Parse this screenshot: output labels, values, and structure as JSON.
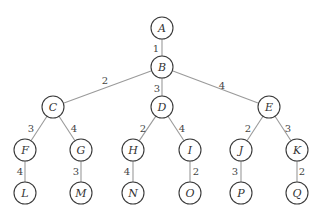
{
  "diagram": {
    "type": "weighted-tree",
    "nodes": [
      {
        "id": "A",
        "label": "A",
        "x": 162,
        "y": 28
      },
      {
        "id": "B",
        "label": "B",
        "x": 162,
        "y": 67
      },
      {
        "id": "C",
        "label": "C",
        "x": 53,
        "y": 107
      },
      {
        "id": "D",
        "label": "D",
        "x": 162,
        "y": 107
      },
      {
        "id": "E",
        "label": "E",
        "x": 269,
        "y": 107
      },
      {
        "id": "F",
        "label": "F",
        "x": 25,
        "y": 150
      },
      {
        "id": "G",
        "label": "G",
        "x": 81,
        "y": 150
      },
      {
        "id": "H",
        "label": "H",
        "x": 133,
        "y": 150
      },
      {
        "id": "I",
        "label": "I",
        "x": 190,
        "y": 150
      },
      {
        "id": "J",
        "label": "J",
        "x": 241,
        "y": 150
      },
      {
        "id": "K",
        "label": "K",
        "x": 297,
        "y": 150
      },
      {
        "id": "L",
        "label": "L",
        "x": 25,
        "y": 193
      },
      {
        "id": "M",
        "label": "M",
        "x": 81,
        "y": 193
      },
      {
        "id": "N",
        "label": "N",
        "x": 133,
        "y": 193
      },
      {
        "id": "O",
        "label": "O",
        "x": 190,
        "y": 193
      },
      {
        "id": "P",
        "label": "P",
        "x": 241,
        "y": 193
      },
      {
        "id": "Q",
        "label": "Q",
        "x": 297,
        "y": 193
      }
    ],
    "edges": [
      {
        "from": "A",
        "to": "B",
        "weight": "1",
        "lx": 156,
        "ly": 48
      },
      {
        "from": "B",
        "to": "C",
        "weight": "2",
        "lx": 105,
        "ly": 80
      },
      {
        "from": "B",
        "to": "D",
        "weight": "3",
        "lx": 157,
        "ly": 88
      },
      {
        "from": "B",
        "to": "E",
        "weight": "4",
        "lx": 222,
        "ly": 85
      },
      {
        "from": "C",
        "to": "F",
        "weight": "3",
        "lx": 31,
        "ly": 128
      },
      {
        "from": "C",
        "to": "G",
        "weight": "4",
        "lx": 74,
        "ly": 128
      },
      {
        "from": "D",
        "to": "H",
        "weight": "2",
        "lx": 143,
        "ly": 128
      },
      {
        "from": "D",
        "to": "I",
        "weight": "4",
        "lx": 182,
        "ly": 128
      },
      {
        "from": "E",
        "to": "J",
        "weight": "2",
        "lx": 248,
        "ly": 128
      },
      {
        "from": "E",
        "to": "K",
        "weight": "3",
        "lx": 288,
        "ly": 128
      },
      {
        "from": "F",
        "to": "L",
        "weight": "4",
        "lx": 20,
        "ly": 171
      },
      {
        "from": "G",
        "to": "M",
        "weight": "3",
        "lx": 76,
        "ly": 171
      },
      {
        "from": "H",
        "to": "N",
        "weight": "4",
        "lx": 127,
        "ly": 171
      },
      {
        "from": "I",
        "to": "O",
        "weight": "2",
        "lx": 196,
        "ly": 171
      },
      {
        "from": "J",
        "to": "P",
        "weight": "3",
        "lx": 235,
        "ly": 171
      },
      {
        "from": "K",
        "to": "Q",
        "weight": "2",
        "lx": 302,
        "ly": 171
      }
    ],
    "node_radius": 11
  }
}
